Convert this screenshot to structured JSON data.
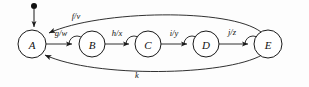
{
  "diagram": {
    "background_color": "#fdfdfd",
    "stroke_color": "#1a1a1a",
    "nodes": [
      {
        "id": "A",
        "label": "A",
        "cx": 32,
        "cy": 44,
        "r": 14
      },
      {
        "id": "B",
        "label": "B",
        "cx": 92,
        "cy": 44,
        "r": 13
      },
      {
        "id": "C",
        "label": "C",
        "cx": 148,
        "cy": 44,
        "r": 13
      },
      {
        "id": "D",
        "label": "D",
        "cx": 206,
        "cy": 44,
        "r": 13
      },
      {
        "id": "E",
        "label": "E",
        "cx": 268,
        "cy": 44,
        "r": 14
      }
    ],
    "edges": [
      {
        "id": "ab",
        "from": "A",
        "to": "B",
        "label": "g/w",
        "shape": "straight"
      },
      {
        "id": "bc",
        "from": "B",
        "to": "C",
        "label": "h/x",
        "shape": "straight"
      },
      {
        "id": "cd",
        "from": "C",
        "to": "D",
        "label": "i/y",
        "shape": "straight"
      },
      {
        "id": "de",
        "from": "D",
        "to": "E",
        "label": "j/z",
        "shape": "straight"
      },
      {
        "id": "ea_top",
        "from": "E",
        "to": "A",
        "label": "f/v",
        "shape": "curve-above"
      },
      {
        "id": "ea_bottom",
        "from": "E",
        "to": "A",
        "label": "k",
        "shape": "curve-below"
      }
    ],
    "start_marker": {
      "target": "A",
      "dot_x": 34,
      "dot_y": 6,
      "dot_r": 3
    }
  }
}
